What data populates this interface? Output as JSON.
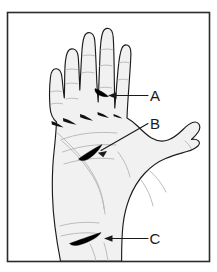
{
  "figure": {
    "frame": {
      "border_color": "#2b2b2b",
      "background_color": "#ffffff"
    },
    "colors": {
      "skin_fill": "#f1f1f1",
      "outline": "#1c1c1c",
      "crease_line": "#b0b0b0",
      "lesion_fill": "#000000",
      "leader_line": "#1a1a1a",
      "label_text": "#1a1a1a"
    },
    "labels": [
      {
        "id": "A",
        "text": "A",
        "x": 155,
        "y": 100,
        "target": "lesion on middle finger, middle phalanx",
        "leader_type": "horizontal"
      },
      {
        "id": "B",
        "text": "B",
        "x": 155,
        "y": 128,
        "target": "lesion on upper palm below index finger",
        "leader_type": "diagonal"
      },
      {
        "id": "C",
        "text": "C",
        "x": 155,
        "y": 243,
        "target": "lesion on lower palm near wrist",
        "leader_type": "horizontal"
      }
    ],
    "lesions": [
      {
        "id": "lesion-a",
        "label": "A",
        "location": "middle-finger"
      },
      {
        "id": "lesion-b",
        "label": "B",
        "location": "upper-palm"
      },
      {
        "id": "lesion-c",
        "label": "C",
        "location": "lower-palm"
      }
    ],
    "anatomy": {
      "digits": [
        "index-finger",
        "middle-finger",
        "ring-finger",
        "little-finger",
        "thumb"
      ],
      "regions": [
        "palm",
        "thenar-eminence",
        "hypothenar-eminence",
        "wrist"
      ]
    }
  }
}
